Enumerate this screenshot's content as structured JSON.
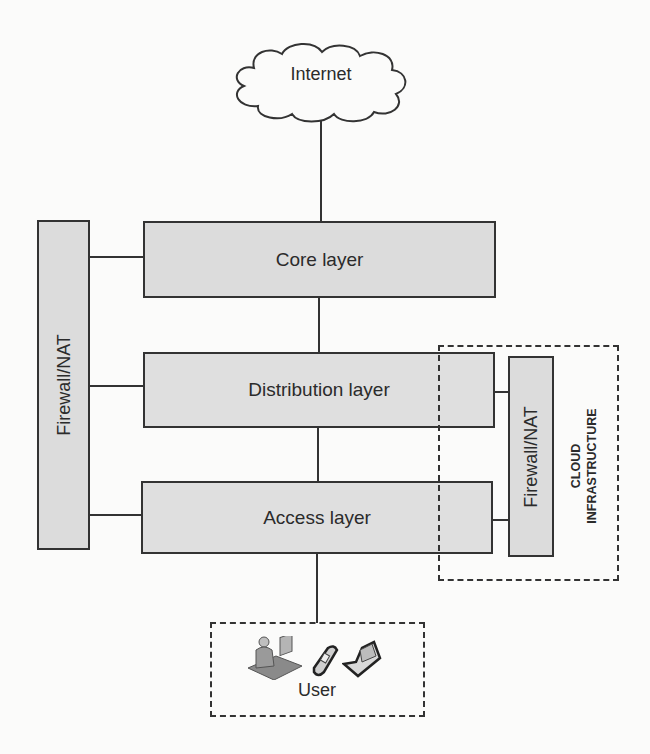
{
  "diagram": {
    "internet": {
      "label": "Internet",
      "icon": "cloud-icon"
    },
    "layers": [
      {
        "id": "core",
        "label": "Core layer"
      },
      {
        "id": "distribution",
        "label": "Distribution layer"
      },
      {
        "id": "access",
        "label": "Access layer"
      }
    ],
    "left_firewall": {
      "label": "Firewall/NAT"
    },
    "cloud_infrastructure": {
      "label_line1": "CLOUD",
      "label_line2": "INFRASTRUCTURE",
      "firewall": {
        "label": "Firewall/NAT"
      }
    },
    "user": {
      "label": "User",
      "icons": [
        "person-at-desk-icon",
        "mobile-phone-icon",
        "laptop-icon"
      ]
    },
    "colors": {
      "box_fill": "#dcdcdc",
      "stroke": "#333333",
      "background": "#fbfbfa"
    }
  }
}
